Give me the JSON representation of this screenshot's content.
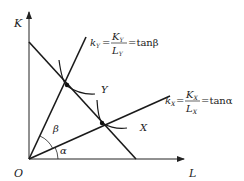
{
  "diagram": {
    "axes": {
      "y_label": "K",
      "x_label": "L",
      "origin_label": "O"
    },
    "rays": {
      "k_y": {
        "lhs": "k",
        "lhs_sub": "Y",
        "num": "K",
        "num_sub": "Y",
        "den": "L",
        "den_sub": "Y",
        "rhs": "=tanβ"
      },
      "k_x": {
        "lhs": "k",
        "lhs_sub": "X",
        "num": "K",
        "num_sub": "X",
        "den": "L",
        "den_sub": "X",
        "rhs": "=tanα"
      }
    },
    "isoquants": {
      "y": "Y",
      "x": "X"
    },
    "angles": {
      "beta": "β",
      "alpha": "α"
    },
    "colors": {
      "line": "#1a1a1a"
    }
  }
}
